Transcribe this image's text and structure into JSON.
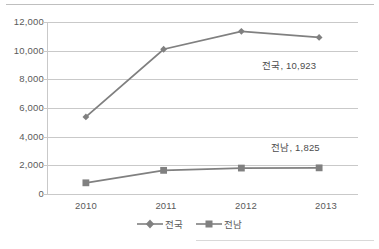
{
  "chart_data": {
    "type": "line",
    "title": "",
    "subtitle": "",
    "xlabel": "",
    "ylabel": "",
    "categories": [
      "2010",
      "2011",
      "2012",
      "2013"
    ],
    "ylim": [
      0,
      12000
    ],
    "ytick_labels": [
      "0",
      "2,000",
      "4,000",
      "6,000",
      "8,000",
      "10,000",
      "12,000"
    ],
    "ytick_values": [
      0,
      2000,
      4000,
      6000,
      8000,
      10000,
      12000
    ],
    "grid": true,
    "legend_position": "bottom",
    "series": [
      {
        "name": "전국",
        "marker": "diamond",
        "color": "#808080",
        "values": [
          5380,
          10100,
          11350,
          10923
        ]
      },
      {
        "name": "전남",
        "marker": "square",
        "color": "#808080",
        "values": [
          780,
          1650,
          1810,
          1825
        ]
      }
    ],
    "annotations": [
      {
        "text": "전국, 10,923",
        "series": "전국",
        "category": "2013"
      },
      {
        "text": "전남, 1,825",
        "series": "전남",
        "category": "2013"
      }
    ]
  },
  "axis": {
    "y_labels": [
      "12,000",
      "10,000",
      "8,000",
      "6,000",
      "4,000",
      "2,000",
      "0"
    ],
    "x_labels": [
      "2010",
      "2011",
      "2012",
      "2013"
    ]
  },
  "labels": {
    "national": "전국, 10,923",
    "jeonnam": "전남, 1,825"
  },
  "legend": {
    "items": [
      {
        "label": "전국",
        "marker": "diamond-marker"
      },
      {
        "label": "전남",
        "marker": "square-marker"
      }
    ]
  },
  "colors": {
    "series": "#808080",
    "gridline": "#c9c9c9",
    "text": "#5a5a5a"
  }
}
